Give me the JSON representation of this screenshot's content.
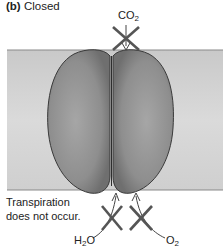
{
  "title": {
    "panel": "(b)",
    "text": "Closed"
  },
  "labels": {
    "co2": {
      "main": "CO",
      "sub": "2"
    },
    "h2o": {
      "pre": "H",
      "sub": "2",
      "post": "O"
    },
    "o2": {
      "main": "O",
      "sub": "2"
    }
  },
  "note": {
    "line1": "Transpiration",
    "line2": "does not occur."
  },
  "colors": {
    "band": "#d4d4d4",
    "band_edge": "#8a8a8a",
    "cell_fill": "#8f8f8f",
    "cell_outline": "#3a3a3a",
    "cross": "#555555"
  },
  "diagram": {
    "state": "stomata closed",
    "blocked_flows": [
      "CO2 in",
      "H2O out",
      "O2 out"
    ]
  }
}
